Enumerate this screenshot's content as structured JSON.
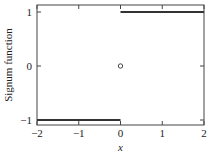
{
  "chart_data": {
    "type": "line",
    "title": "",
    "xlabel": "x",
    "ylabel": "Signum function",
    "xlim": [
      -2,
      2
    ],
    "ylim": [
      -1.12,
      1.12
    ],
    "x_ticks": [
      -2,
      -1,
      0,
      1,
      2
    ],
    "x_tick_labels": [
      "−2",
      "−1",
      "0",
      "1",
      "2"
    ],
    "y_ticks": [
      -1,
      0,
      1
    ],
    "y_tick_labels": [
      "−1",
      "0",
      "1"
    ],
    "grid": false,
    "legend": null,
    "series": [
      {
        "name": "sgn(x), x<0",
        "x": [
          -2,
          0
        ],
        "y": [
          -1,
          -1
        ],
        "style": "solid"
      },
      {
        "name": "sgn(x), x>0",
        "x": [
          0,
          2
        ],
        "y": [
          1,
          1
        ],
        "style": "solid"
      },
      {
        "name": "sgn(0)",
        "x": [
          0
        ],
        "y": [
          0
        ],
        "style": "open-circle-marker"
      }
    ],
    "colors": {
      "line": "#333333",
      "axes": "#444444"
    }
  }
}
